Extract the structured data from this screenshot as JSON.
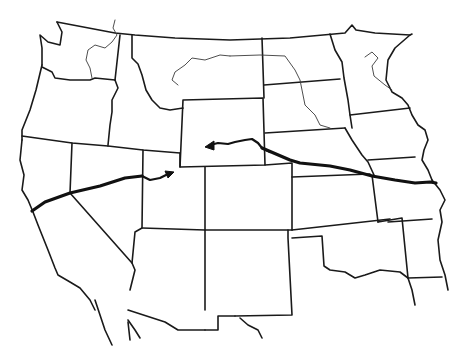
{
  "map": {
    "type": "outline map",
    "region": "Western and Central United States",
    "style": "black line art on white",
    "colors": {
      "background": "#ffffff",
      "lines": "#1a1a1a",
      "route": "#111111"
    },
    "features": {
      "state_borders": true,
      "rivers": [
        "Columbia/Snake",
        "Missouri (upper)",
        "Missouri (lower)",
        "Mississippi (upper)"
      ],
      "routes": [
        {
          "name": "westward-route-to-sierra",
          "from": "Missouri River",
          "to": "Central Nevada/California",
          "arrowheads": [
            "Utah/Colorado border",
            "Wyoming"
          ]
        }
      ]
    },
    "labels": []
  }
}
